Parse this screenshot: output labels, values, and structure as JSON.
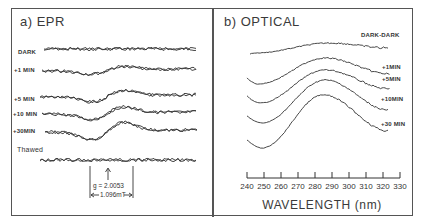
{
  "figure": {
    "panel_a": {
      "title": "a) EPR",
      "traces": [
        {
          "label": "DARK",
          "label_y": 52,
          "baseline": 49,
          "amp": 0
        },
        {
          "label": "+1 MIN",
          "label_y": 70,
          "baseline": 70,
          "amp": 6
        },
        {
          "label": "+5 MIN",
          "label_y": 99,
          "baseline": 96,
          "amp": 9
        },
        {
          "label": "+10 MIN",
          "label_y": 114,
          "baseline": 113,
          "amp": 10
        },
        {
          "label": "+30MIN",
          "label_y": 131,
          "baseline": 131,
          "amp": 14
        },
        {
          "label": "Thawed",
          "label_y": 148,
          "baseline": 160,
          "amp": 0
        }
      ],
      "annotation": {
        "g_value": "g = 2.0053",
        "linewidth": "1.096mT"
      }
    },
    "panel_b": {
      "title": "b) OPTICAL",
      "traces": [
        {
          "label": "DARK-DARK"
        },
        {
          "label": "+1MIN"
        },
        {
          "label": "+5MIN"
        },
        {
          "label": "+10MIN"
        },
        {
          "label": "+30 MIN"
        }
      ],
      "x_axis": {
        "title": "WAVELENGTH  (nm)",
        "ticks": [
          "240",
          "250",
          "260",
          "270",
          "280",
          "290",
          "300",
          "310",
          "320",
          "330"
        ]
      }
    }
  },
  "chart_data": [
    {
      "type": "line",
      "title": "a) EPR",
      "xlabel": "",
      "ylabel": "",
      "series": [
        {
          "name": "DARK",
          "description": "flat noisy baseline, no signal"
        },
        {
          "name": "+1 MIN",
          "description": "weak derivative signal"
        },
        {
          "name": "+5 MIN",
          "description": "derivative signal, growing"
        },
        {
          "name": "+10 MIN",
          "description": "derivative signal"
        },
        {
          "name": "+30MIN",
          "description": "strongest derivative signal"
        },
        {
          "name": "Thawed",
          "description": "flat noisy baseline, signal gone"
        }
      ],
      "annotations": [
        "g = 2.0053",
        "1.096mT"
      ]
    },
    {
      "type": "line",
      "title": "b) OPTICAL",
      "xlabel": "WAVELENGTH (nm)",
      "ylabel": "",
      "xlim": [
        240,
        330
      ],
      "x": [
        240,
        250,
        260,
        270,
        280,
        290,
        300,
        310,
        320,
        330
      ],
      "series": [
        {
          "name": "DARK-DARK",
          "peak_nm": 290,
          "description": "nearly flat, slight rise"
        },
        {
          "name": "+1MIN",
          "peak_nm": 286,
          "min_nm": 250
        },
        {
          "name": "+5MIN",
          "peak_nm": 286,
          "min_nm": 252
        },
        {
          "name": "+10MIN",
          "peak_nm": 286,
          "min_nm": 252
        },
        {
          "name": "+30 MIN",
          "peak_nm": 285,
          "min_nm": 252
        }
      ],
      "grid": false,
      "legend": "inline labels at right"
    }
  ]
}
